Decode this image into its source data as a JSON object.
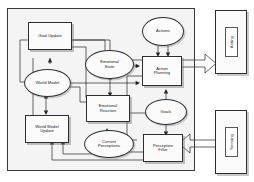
{
  "diagram": {
    "boundary_label": "",
    "internal_nodes": [
      {
        "id": "goal-update",
        "label": "Goal Update",
        "shape": "rect"
      },
      {
        "id": "world-model",
        "label": "World Model",
        "shape": "ellipse"
      },
      {
        "id": "world-model-update",
        "label": "World Model\nUpdate",
        "shape": "rect"
      },
      {
        "id": "emotional-state",
        "label": "Emotional\nState",
        "shape": "ellipse"
      },
      {
        "id": "emotional-reaction",
        "label": "Emotional\nReaction",
        "shape": "rect"
      },
      {
        "id": "current-perceptions",
        "label": "Current\nPerceptions",
        "shape": "ellipse"
      },
      {
        "id": "actions",
        "label": "Actions",
        "shape": "ellipse"
      },
      {
        "id": "action-planning",
        "label": "Action\nPlanning",
        "shape": "rect"
      },
      {
        "id": "goals",
        "label": "Goals",
        "shape": "ellipse"
      },
      {
        "id": "perception-filter",
        "label": "Perception\nFilter",
        "shape": "rect"
      }
    ],
    "external_nodes": [
      {
        "id": "acting",
        "label": "Acting"
      },
      {
        "id": "sensing",
        "label": "Sensing"
      }
    ],
    "colors": {
      "stroke": "#242424",
      "boundary_fill": "#f4f4f4",
      "node_fill": "#fbfbfb",
      "page_background": "#ffffff"
    }
  }
}
